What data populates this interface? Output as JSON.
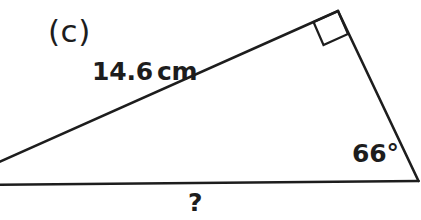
{
  "figure": {
    "part_label": "(c)",
    "shape": "right-triangle",
    "stroke_color": "#1d1d1d",
    "background_color": "#ffffff",
    "text_color": "#1d1d1d",
    "labels": {
      "hypotenuse_length": "14.6",
      "hypotenuse_unit": "cm",
      "angle": "66°",
      "unknown_side": "?"
    },
    "geometry": {
      "apex_vertex": [
        338,
        11
      ],
      "right_vertex": [
        418,
        181
      ],
      "left_vertex": [
        -28,
        174
      ],
      "baseline_left_edge": [
        0,
        184
      ],
      "hypotenuse_left_edge": [
        0,
        163
      ],
      "right_angle_marker": [
        [
          338,
          11
        ],
        [
          313,
          22
        ],
        [
          323,
          45
        ],
        [
          348,
          35
        ]
      ]
    }
  }
}
